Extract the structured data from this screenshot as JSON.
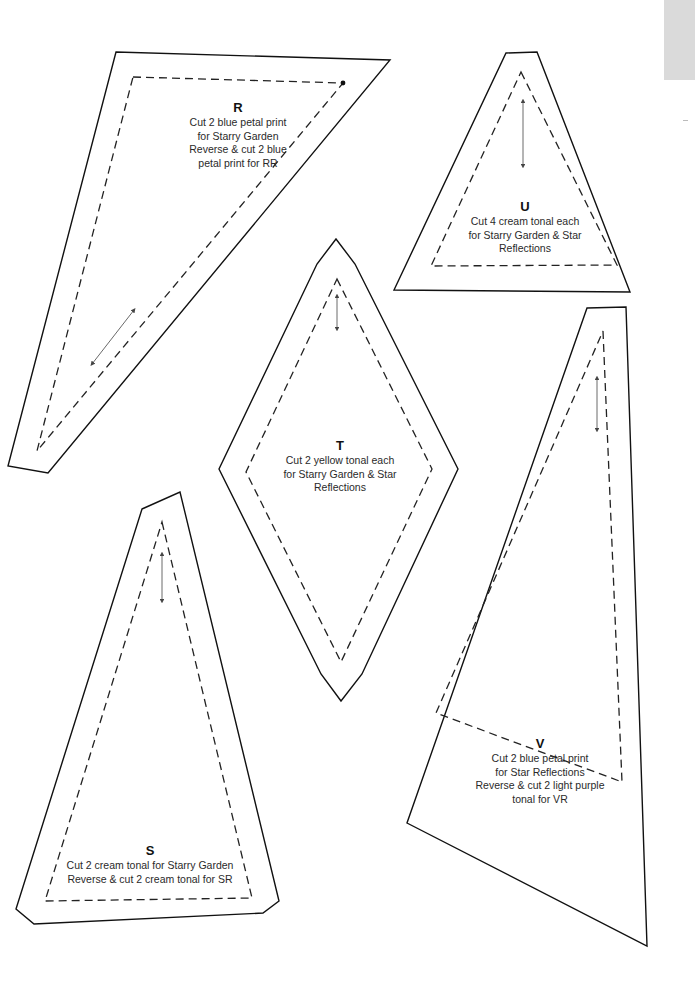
{
  "page": {
    "type": "quilt pattern templates",
    "side_tab_color": "#dadada"
  },
  "pieces": [
    {
      "id": "R",
      "letter": "R",
      "lines": [
        "Cut 2 blue petal print",
        "for Starry Garden",
        "Reverse & cut 2 blue",
        "petal print for RR"
      ]
    },
    {
      "id": "U",
      "letter": "U",
      "lines": [
        "Cut 4 cream tonal each",
        "for Starry Garden & Star",
        "Reflections"
      ]
    },
    {
      "id": "T",
      "letter": "T",
      "lines": [
        "Cut 2 yellow tonal each",
        "for Starry Garden & Star",
        "Reflections"
      ]
    },
    {
      "id": "S",
      "letter": "S",
      "lines": [
        "Cut 2 cream tonal for Starry Garden",
        "Reverse & cut 2 cream tonal for SR"
      ]
    },
    {
      "id": "V",
      "letter": "V",
      "lines": [
        "Cut 2 blue petal print",
        "for Star Reflections",
        "Reverse & cut 2 light purple",
        "tonal for VR"
      ]
    }
  ],
  "icons": {
    "grainline": "double-headed-arrow",
    "seam": "dashed-line",
    "cut_line": "solid-line"
  }
}
